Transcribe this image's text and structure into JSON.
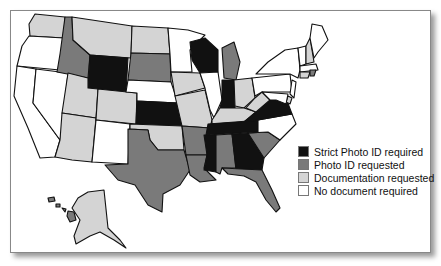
{
  "categories": {
    "strict": {
      "label": "Strict Photo ID required",
      "color": "#111111"
    },
    "photo": {
      "label": "Photo ID requested",
      "color": "#7a7a7a"
    },
    "doc": {
      "label": "Documentation requested",
      "color": "#d4d4d4"
    },
    "none": {
      "label": "No document required",
      "color": "#ffffff"
    }
  },
  "legend": [
    {
      "key": "strict",
      "label": "Strict Photo ID required",
      "color": "#111111"
    },
    {
      "key": "photo",
      "label": "Photo ID requested",
      "color": "#7a7a7a"
    },
    {
      "key": "doc",
      "label": "Documentation requested",
      "color": "#d4d4d4"
    },
    {
      "key": "none",
      "label": "No document required",
      "color": "#ffffff"
    }
  ],
  "states": {
    "WA": "doc",
    "OR": "none",
    "CA": "none",
    "NV": "none",
    "ID": "photo",
    "MT": "doc",
    "WY": "strict",
    "UT": "doc",
    "AZ": "doc",
    "CO": "doc",
    "NM": "none",
    "ND": "doc",
    "SD": "photo",
    "NE": "none",
    "KS": "strict",
    "OK": "doc",
    "TX": "photo",
    "MN": "none",
    "IA": "doc",
    "MO": "doc",
    "AR": "photo",
    "LA": "photo",
    "WI": "strict",
    "IL": "none",
    "MI": "photo",
    "IN": "strict",
    "OH": "doc",
    "KY": "doc",
    "TN": "strict",
    "MS": "strict",
    "AL": "photo",
    "GA": "strict",
    "FL": "photo",
    "SC": "photo",
    "NC": "none",
    "VA": "strict",
    "WV": "doc",
    "PA": "none",
    "NY": "none",
    "VT": "none",
    "NH": "doc",
    "ME": "none",
    "MA": "none",
    "RI": "photo",
    "CT": "doc",
    "NJ": "none",
    "DE": "doc",
    "MD": "none",
    "AK": "doc",
    "HI": "photo"
  }
}
